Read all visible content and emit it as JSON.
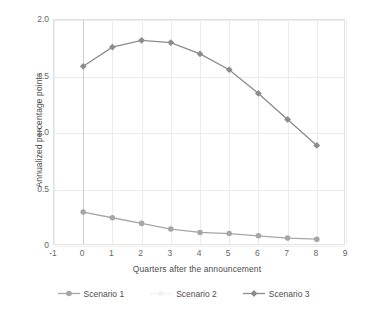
{
  "chart_data": {
    "type": "line",
    "title": "",
    "xlabel": "Quarters after the announcement",
    "ylabel": "Annualized percentage points",
    "x": [
      0,
      1,
      2,
      3,
      4,
      5,
      6,
      7,
      8
    ],
    "xlim": [
      -1,
      9
    ],
    "ylim": [
      0,
      2.0
    ],
    "xticks": [
      "-1",
      "0",
      "1",
      "2",
      "3",
      "4",
      "5",
      "6",
      "7",
      "8",
      "9"
    ],
    "yticks": [
      "0",
      "0.5",
      "1.0",
      "1.5",
      "2.0"
    ],
    "grid": true,
    "legend_position": "bottom-center",
    "series": [
      {
        "name": "Scenario 1",
        "marker": "circle",
        "color": "#a6a6a6",
        "values": [
          0.3,
          0.25,
          0.2,
          0.15,
          0.12,
          0.11,
          0.09,
          0.07,
          0.06
        ]
      },
      {
        "name": "Scenario 2",
        "marker": "circle",
        "color": "#f2f2f2",
        "values": [
          null,
          null,
          null,
          null,
          null,
          null,
          null,
          null,
          null
        ]
      },
      {
        "name": "Scenario 3",
        "marker": "diamond",
        "color": "#8c8c8c",
        "values": [
          1.59,
          1.76,
          1.82,
          1.8,
          1.7,
          1.56,
          1.35,
          1.12,
          0.89
        ]
      }
    ]
  },
  "axis": {
    "y_title": "Annualized percentage points",
    "x_title": "Quarters after the announcement",
    "yticks": [
      "2.0",
      "1.5",
      "1.0",
      "0.5",
      "0"
    ],
    "xticks": [
      "-1",
      "0",
      "1",
      "2",
      "3",
      "4",
      "5",
      "6",
      "7",
      "8",
      "9"
    ]
  },
  "legend": {
    "items": [
      {
        "label": "Scenario 1",
        "marker": "circle-marker",
        "color": "#a6a6a6"
      },
      {
        "label": "Scenario 2",
        "marker": "circle-marker",
        "color": "#f2f2f2"
      },
      {
        "label": "Scenario 3",
        "marker": "diamond-marker",
        "color": "#8c8c8c"
      }
    ]
  }
}
